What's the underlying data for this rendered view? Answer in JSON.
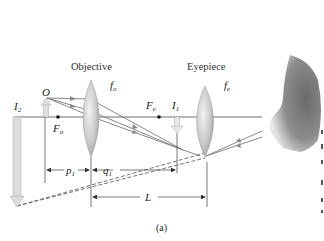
{
  "diagram": {
    "type": "compound-microscope-ray-diagram",
    "caption": "(a)",
    "lenses": [
      {
        "name": "Objective",
        "focal_label": "f",
        "focal_sub": "o"
      },
      {
        "name": "Eyepiece",
        "focal_label": "f",
        "focal_sub": "e"
      }
    ],
    "points": {
      "object": "O",
      "objective_focus": {
        "main": "F",
        "sub": "o"
      },
      "eyepiece_focus": {
        "main": "F",
        "sub": "e"
      },
      "image1": {
        "main": "I",
        "sub": "1"
      },
      "image2": {
        "main": "I",
        "sub": "2"
      }
    },
    "dimensions": {
      "p1": {
        "main": "p",
        "sub": "1"
      },
      "q1": {
        "main": "q",
        "sub": "1"
      },
      "L": "L"
    },
    "colors": {
      "axis": "#6e6e6e",
      "ray": "#7a7a7a",
      "arrow_fill": "#d9d9d9",
      "lens_fill": "#c8c8c8",
      "eye_skin": "#8a8a8a"
    }
  }
}
